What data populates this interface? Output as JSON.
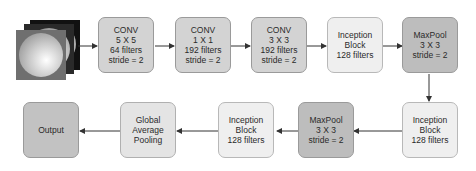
{
  "diagram": {
    "input": {
      "label": "input-image-stack",
      "layers": 3
    },
    "top_row": [
      {
        "id": "conv5",
        "type": "conv",
        "lines": [
          "CONV",
          "5 X 5",
          "64 filters",
          "stride = 2"
        ]
      },
      {
        "id": "conv1",
        "type": "conv",
        "lines": [
          "CONV",
          "1 X 1",
          "192 filters",
          "stride = 2"
        ]
      },
      {
        "id": "conv3",
        "type": "conv",
        "lines": [
          "CONV",
          "3 X 3",
          "192 filters",
          "stride = 2"
        ]
      },
      {
        "id": "incep1",
        "type": "incep",
        "lines": [
          "Inception",
          "Block",
          "128 filters"
        ]
      },
      {
        "id": "pool1",
        "type": "pool",
        "lines": [
          "MaxPool",
          "3 X 3",
          "stride = 2"
        ]
      }
    ],
    "bottom_row": [
      {
        "id": "incep2",
        "type": "incep",
        "lines": [
          "Inception",
          "Block",
          "128 filters"
        ]
      },
      {
        "id": "pool2",
        "type": "pool",
        "lines": [
          "MaxPool",
          "3 X 3",
          "stride = 2"
        ]
      },
      {
        "id": "incep3",
        "type": "incep",
        "lines": [
          "Inception",
          "Block",
          "128 filters"
        ]
      },
      {
        "id": "gap",
        "type": "gap",
        "lines": [
          "Global",
          "Average",
          "Pooling"
        ]
      },
      {
        "id": "output",
        "type": "out",
        "lines": [
          "Output"
        ]
      }
    ],
    "colors": {
      "conv": "#d3d3d3",
      "inception": "#efefef",
      "maxpool": "#bdbdbd",
      "gap": "#e4e4e4",
      "output": "#c2c2c2",
      "arrow": "#333333"
    }
  }
}
